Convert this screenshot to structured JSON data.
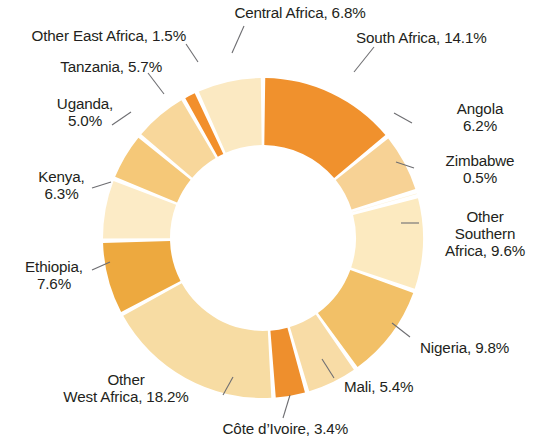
{
  "chart_data": {
    "type": "pie",
    "variant": "donut",
    "title": "",
    "subtitle": "",
    "xlabel": "",
    "ylabel": "",
    "legend_position": "none",
    "grid": false,
    "units": "percent",
    "total": 100.0,
    "labels_show_percent": true,
    "categories": [
      "South Africa",
      "Angola",
      "Zimbabwe",
      "Other Southern Africa",
      "Nigeria",
      "Mali",
      "Côte d’Ivoire",
      "Other West Africa",
      "Ethiopia",
      "Kenya",
      "Uganda",
      "Tanzania",
      "Other East Africa",
      "Central Africa"
    ],
    "values": [
      14.1,
      6.2,
      0.5,
      9.6,
      9.8,
      5.4,
      3.4,
      18.2,
      7.6,
      6.3,
      5.0,
      5.7,
      1.5,
      6.8
    ],
    "colors": [
      "#F0912D",
      "#F7D295",
      "#FDF0D4",
      "#FCEAC0",
      "#F2C067",
      "#F8DCA6",
      "#EE8F2D",
      "#F7DCA3",
      "#EDA93F",
      "#FCEBC6",
      "#F5C878",
      "#F8D79B",
      "#F28F2B",
      "#FBE9C2"
    ],
    "slice_labels": [
      "South Africa, 14.1%",
      "Angola\n6.2%",
      "Zimbabwe\n0.5%",
      "Other\nSouthern\nAfrica, 9.6%",
      "Nigeria, 9.8%",
      "Mali, 5.4%",
      "Côte d’Ivoire, 3.4%",
      "Other\nWest Africa, 18.2%",
      "Ethiopia,\n7.6%",
      "Kenya,\n6.3%",
      "Uganda,\n5.0%",
      "Tanzania, 5.7%",
      "Other East Africa, 1.5%",
      "Central Africa, 6.8%"
    ],
    "start_angle_deg": 0,
    "direction": "clockwise",
    "inner_radius_px": 93,
    "outer_radius_px": 160,
    "center": {
      "x": 263,
      "y": 238
    },
    "gap_deg": 1.6,
    "background": "#FFFFFF",
    "text_color": "#231F20",
    "leader_line_color": "#6E6E72"
  },
  "labels": [
    {
      "name": "central-africa",
      "text": "Central Africa, 6.8%",
      "x": 205,
      "y": 4,
      "w": 190,
      "align": "lbl-center"
    },
    {
      "name": "south-africa",
      "text": "South Africa, 14.1%",
      "x": 356,
      "y": 29,
      "w": 180,
      "align": "lbl-right"
    },
    {
      "name": "other-east-africa",
      "text": "Other East Africa, 1.5%",
      "x": 6,
      "y": 27,
      "w": 180,
      "align": "lbl-left"
    },
    {
      "name": "tanzania",
      "text": "Tanzania, 5.7%",
      "x": 22,
      "y": 58,
      "w": 140,
      "align": "lbl-left"
    },
    {
      "name": "angola",
      "text": "Angola\n6.2%",
      "x": 430,
      "y": 100,
      "w": 100,
      "align": "lbl-center"
    },
    {
      "name": "uganda",
      "text": "Uganda,\n5.0%",
      "x": 35,
      "y": 95,
      "w": 100,
      "align": "lbl-center"
    },
    {
      "name": "zimbabwe",
      "text": "Zimbabwe\n0.5%",
      "x": 425,
      "y": 152,
      "w": 110,
      "align": "lbl-center"
    },
    {
      "name": "kenya",
      "text": "Kenya,\n6.3%",
      "x": 14,
      "y": 168,
      "w": 95,
      "align": "lbl-center"
    },
    {
      "name": "other-southern-africa",
      "text": "Other\nSouthern\nAfrica, 9.6%",
      "x": 430,
      "y": 208,
      "w": 110,
      "align": "lbl-center"
    },
    {
      "name": "ethiopia",
      "text": "Ethiopia,\n7.6%",
      "x": 4,
      "y": 258,
      "w": 100,
      "align": "lbl-center"
    },
    {
      "name": "nigeria",
      "text": "Nigeria, 9.8%",
      "x": 420,
      "y": 339,
      "w": 125,
      "align": "lbl-right"
    },
    {
      "name": "mali",
      "text": "Mali, 5.4%",
      "x": 344,
      "y": 378,
      "w": 105,
      "align": "lbl-right"
    },
    {
      "name": "other-west-africa",
      "text": "Other\nWest Africa, 18.2%",
      "x": 36,
      "y": 371,
      "w": 180,
      "align": "lbl-center"
    },
    {
      "name": "cote-divoire",
      "text": "Côte d’Ivoire, 3.4%",
      "x": 173,
      "y": 420,
      "w": 175,
      "align": "lbl-left"
    }
  ],
  "leader_lines": [
    {
      "name": "leader-central-africa",
      "x1": 244,
      "y1": 26,
      "x2": 232,
      "y2": 53
    },
    {
      "name": "leader-south-africa",
      "x1": 374,
      "y1": 47,
      "x2": 354,
      "y2": 72
    },
    {
      "name": "leader-other-east-africa",
      "x1": 186,
      "y1": 44,
      "x2": 198,
      "y2": 62
    },
    {
      "name": "leader-tanzania",
      "x1": 148,
      "y1": 73,
      "x2": 164,
      "y2": 94
    },
    {
      "name": "leader-angola",
      "x1": 412,
      "y1": 123,
      "x2": 394,
      "y2": 113
    },
    {
      "name": "leader-uganda",
      "x1": 112,
      "y1": 125,
      "x2": 131,
      "y2": 112
    },
    {
      "name": "leader-zimbabwe",
      "x1": 414,
      "y1": 168,
      "x2": 396,
      "y2": 162
    },
    {
      "name": "leader-kenya",
      "x1": 92,
      "y1": 188,
      "x2": 111,
      "y2": 182
    },
    {
      "name": "leader-other-southern-africa",
      "x1": 419,
      "y1": 223,
      "x2": 401,
      "y2": 223
    },
    {
      "name": "leader-ethiopia",
      "x1": 92,
      "y1": 270,
      "x2": 110,
      "y2": 262
    },
    {
      "name": "leader-nigeria",
      "x1": 410,
      "y1": 337,
      "x2": 392,
      "y2": 323
    },
    {
      "name": "leader-mali",
      "x1": 334,
      "y1": 378,
      "x2": 322,
      "y2": 359
    },
    {
      "name": "leader-other-west-africa",
      "x1": 233,
      "y1": 377,
      "x2": 223,
      "y2": 395
    },
    {
      "name": "leader-cote-divoire",
      "x1": 290,
      "y1": 395,
      "x2": 283,
      "y2": 418
    }
  ]
}
